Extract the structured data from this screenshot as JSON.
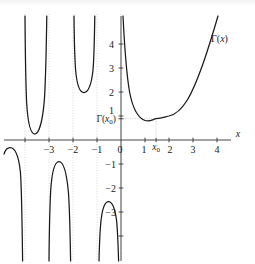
{
  "chart_data": {
    "type": "line",
    "title": "",
    "subtitle": "",
    "xlabel": "x",
    "ylabel": "",
    "curve_label": "Γ(x)",
    "xlim": [
      -4.3,
      4.6
    ],
    "ylim": [
      -4.3,
      4.8
    ],
    "grid": "dotted vertical lines at integer x",
    "legend_position": "inline-right",
    "x_ticks": [
      -3,
      -2,
      -1,
      0,
      1,
      2,
      3,
      4
    ],
    "x_tick_labels": [
      "−3",
      "−2",
      "−1",
      "0",
      "1",
      "2",
      "3",
      "4"
    ],
    "y_ticks": [
      -3,
      -2,
      -1,
      1,
      2,
      3,
      4
    ],
    "y_tick_labels": [
      "−3",
      "−2",
      "−1",
      "1",
      "2",
      "3",
      "4"
    ],
    "annotations": [
      {
        "name": "minimum-y-label",
        "text": "Γ(x₀)",
        "value": 0.8856,
        "axis": "y"
      },
      {
        "name": "minimum-x-label",
        "text": "x₀",
        "value": 1.4616,
        "axis": "x"
      }
    ],
    "poles": [
      0,
      -1,
      -2,
      -3,
      -4
    ],
    "minimum_point": {
      "x": 1.4616,
      "y": 0.8856
    },
    "series": [
      {
        "name": "Γ(x) branch x>0",
        "domain": [
          0.08,
          4.05
        ],
        "points": [
          [
            0.08,
            12.0
          ],
          [
            0.1,
            9.51
          ],
          [
            0.12,
            7.86
          ],
          [
            0.15,
            6.22
          ],
          [
            0.18,
            5.13
          ],
          [
            0.2,
            4.59
          ],
          [
            0.25,
            3.63
          ],
          [
            0.3,
            2.99
          ],
          [
            0.35,
            2.54
          ],
          [
            0.4,
            2.22
          ],
          [
            0.45,
            1.97
          ],
          [
            0.5,
            1.77
          ],
          [
            0.6,
            1.49
          ],
          [
            0.7,
            1.3
          ],
          [
            0.8,
            1.16
          ],
          [
            0.9,
            1.07
          ],
          [
            1.0,
            1.0
          ],
          [
            1.1,
            0.951
          ],
          [
            1.2,
            0.918
          ],
          [
            1.3,
            0.897
          ],
          [
            1.46,
            0.886
          ],
          [
            1.6,
            0.894
          ],
          [
            1.8,
            0.931
          ],
          [
            2.0,
            1.0
          ],
          [
            2.2,
            1.102
          ],
          [
            2.4,
            1.242
          ],
          [
            2.6,
            1.43
          ],
          [
            2.8,
            1.676
          ],
          [
            3.0,
            2.0
          ],
          [
            3.2,
            2.424
          ],
          [
            3.4,
            2.981
          ],
          [
            3.6,
            3.717
          ],
          [
            3.8,
            4.694
          ],
          [
            4.0,
            6.0
          ],
          [
            4.05,
            6.4
          ]
        ]
      },
      {
        "name": "Γ(x) branch -1<x<0",
        "domain": [
          -0.96,
          -0.06
        ],
        "note": "negative branch, descends off bottom at both ends, peak near x=-0.50"
      },
      {
        "name": "Γ(x) branch -2<x<-1",
        "domain": [
          -1.96,
          -1.05
        ],
        "note": "positive branch, minimum ≈2.30 at x≈-1.573"
      },
      {
        "name": "Γ(x) branch -3<x<-2",
        "domain": [
          -2.96,
          -2.04
        ],
        "note": "negative branch, peak ≈-0.89 at x≈-2.611"
      },
      {
        "name": "Γ(x) branch -4<x<-3",
        "domain": [
          -3.97,
          -3.03
        ],
        "note": "positive branch, minimum ≈0.246 at x≈-3.635"
      },
      {
        "name": "Γ(x) branch x<-4",
        "domain": [
          -4.3,
          -4.04
        ],
        "note": "negative branch entering from left edge, peak below axis"
      }
    ]
  },
  "figure": {
    "caption": "",
    "x_axis_name": "x",
    "curve_name": "Γ(x)"
  }
}
